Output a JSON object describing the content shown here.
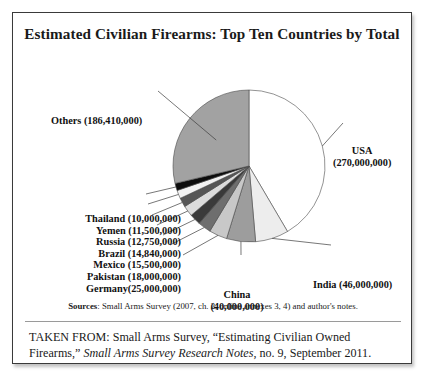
{
  "figure": {
    "title": "Estimated Civilian Firearms: Top Ten Countries by Total",
    "sources_label": "Sources",
    "sources_text": ": Small Arms Survey (2007, ch. 2, online annexes 3, 4) and author's notes.",
    "attribution_prefix": "TAKEN FROM: Small Arms Survey, “Estimating Civilian Owned Firearms,” ",
    "attribution_italic": "Small Arms Survey Research Notes",
    "attribution_suffix": ", no. 9, September 2011."
  },
  "labels": {
    "others": "Others (186,410,000)",
    "usa_name": "USA",
    "usa_value": "(270,000,000)",
    "india": "India (46,000,000)",
    "china_name": "China",
    "china_value": "(40,000,000)",
    "germany": "Germany(25,000,000)",
    "pakistan": "Pakistan (18,000,000)",
    "mexico": "Mexico (15,500,000)",
    "brazil": "Brazil (14,840,000)",
    "russia": "Russia (12,750,000)",
    "yemen": "Yemen (11,500,000)",
    "thailand": "Thailand (10,000,000)"
  },
  "chart_data": {
    "type": "pie",
    "title": "Estimated Civilian Firearms: Top Ten Countries by Total",
    "unit": "firearms",
    "total": 654000000,
    "start_angle_deg": 0,
    "direction": "clockwise",
    "legend": "none-labels-with-leader-lines",
    "slices": [
      {
        "label": "USA",
        "value": 270000000,
        "display": "USA (270,000,000)",
        "color": "#ffffff"
      },
      {
        "label": "India",
        "value": 46000000,
        "display": "India (46,000,000)",
        "color": "#ededed"
      },
      {
        "label": "China",
        "value": 40000000,
        "display": "China (40,000,000)",
        "color": "#9d9d9d"
      },
      {
        "label": "Germany",
        "value": 25000000,
        "display": "Germany(25,000,000)",
        "color": "#c8c8c8"
      },
      {
        "label": "Pakistan",
        "value": 18000000,
        "display": "Pakistan (18,000,000)",
        "color": "#6e6e6e"
      },
      {
        "label": "Mexico",
        "value": 15500000,
        "display": "Mexico (15,500,000)",
        "color": "#3a3a3a"
      },
      {
        "label": "Brazil",
        "value": 14840000,
        "display": "Brazil (14,840,000)",
        "color": "#dcdcdc"
      },
      {
        "label": "Russia",
        "value": 12750000,
        "display": "Russia (12,750,000)",
        "color": "#565656"
      },
      {
        "label": "Yemen",
        "value": 11500000,
        "display": "Yemen (11,500,000)",
        "color": "#f2f2f2"
      },
      {
        "label": "Thailand",
        "value": 10000000,
        "display": "Thailand (10,000,000)",
        "color": "#0d0d0d"
      },
      {
        "label": "Others",
        "value": 186410000,
        "display": "Others (186,410,000)",
        "color": "#a2a2a2"
      }
    ]
  }
}
